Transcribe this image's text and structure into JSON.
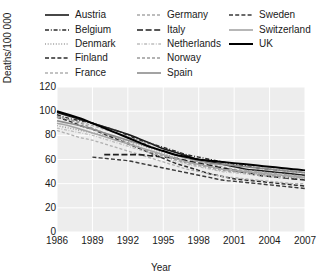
{
  "chart_data": {
    "type": "line",
    "title": "",
    "xlabel": "Year",
    "ylabel": "Deaths/100 000",
    "xlim": [
      1986,
      2007
    ],
    "ylim": [
      0,
      120
    ],
    "xticks": [
      1986,
      1989,
      1992,
      1995,
      1998,
      2001,
      2004,
      2007
    ],
    "yticks": [
      0,
      20,
      40,
      60,
      80,
      100,
      120
    ],
    "grid": true,
    "legend_position": "top",
    "x": [
      1986,
      1987,
      1988,
      1989,
      1990,
      1991,
      1992,
      1993,
      1994,
      1995,
      1996,
      1997,
      1998,
      1999,
      2000,
      2001,
      2002,
      2003,
      2004,
      2005,
      2006,
      2007
    ],
    "series": [
      {
        "name": "Austria",
        "style": "solid",
        "color": "#1a1a1a",
        "width": 1.6,
        "values": [
          99,
          96,
          93,
          90,
          87,
          84,
          81,
          77,
          73,
          69,
          66,
          63,
          60,
          58,
          56,
          54,
          52,
          51,
          50,
          49,
          48,
          47
        ]
      },
      {
        "name": "Belgium",
        "style": "dashdot",
        "color": "#2b2b2b",
        "width": 1.4,
        "values": [
          97,
          94,
          92,
          90,
          87,
          84,
          80,
          76,
          73,
          70,
          67,
          64,
          62,
          60,
          58,
          56,
          55,
          53,
          52,
          51,
          50,
          49
        ]
      },
      {
        "name": "Denmark",
        "style": "dotted",
        "color": "#9e9e9e",
        "width": 1.4,
        "values": [
          88,
          86,
          84,
          82,
          80,
          78,
          75,
          72,
          69,
          65,
          62,
          59,
          56,
          54,
          52,
          50,
          49,
          48,
          47,
          46,
          45,
          44
        ]
      },
      {
        "name": "Finland",
        "style": "dashed",
        "color": "#2b2b2b",
        "width": 1.5,
        "values": [
          95,
          92,
          88,
          85,
          81,
          77,
          73,
          69,
          65,
          61,
          57,
          54,
          51,
          48,
          46,
          44,
          43,
          42,
          41,
          40,
          39,
          38
        ]
      },
      {
        "name": "France",
        "style": "dashed-fine",
        "color": "#b0b0b0",
        "width": 1.3,
        "values": [
          84,
          81,
          78,
          76,
          73,
          70,
          67,
          64,
          61,
          58,
          55,
          52,
          50,
          48,
          46,
          45,
          44,
          43,
          42,
          41,
          40,
          40
        ]
      },
      {
        "name": "Germany",
        "style": "dashed-fine",
        "color": "#a8a8a8",
        "width": 1.3,
        "values": [
          95,
          93,
          91,
          88,
          85,
          82,
          79,
          75,
          71,
          67,
          64,
          61,
          58,
          56,
          54,
          52,
          51,
          50,
          49,
          48,
          47,
          46
        ]
      },
      {
        "name": "Italy",
        "style": "dashed-long",
        "color": "#1f1f1f",
        "width": 1.6,
        "values": [
          null,
          null,
          null,
          null,
          64,
          64,
          64,
          64,
          63,
          62,
          61,
          59,
          57,
          55,
          53,
          51,
          49,
          47,
          46,
          45,
          44,
          43
        ]
      },
      {
        "name": "Netherlands",
        "style": "dashdot-fine",
        "color": "#bdbdbd",
        "width": 1.3,
        "values": [
          86,
          84,
          82,
          80,
          77,
          74,
          71,
          68,
          65,
          62,
          59,
          56,
          54,
          52,
          50,
          49,
          48,
          47,
          46,
          45,
          45,
          44
        ]
      },
      {
        "name": "Norway",
        "style": "dashed-fine",
        "color": "#9a9a9a",
        "width": 1.3,
        "values": [
          96,
          93,
          90,
          86,
          82,
          78,
          74,
          70,
          66,
          63,
          60,
          57,
          55,
          53,
          51,
          50,
          49,
          48,
          47,
          46,
          46,
          45
        ]
      },
      {
        "name": "Spain",
        "style": "solid",
        "color": "#8c8c8c",
        "width": 1.6,
        "values": [
          92,
          90,
          88,
          85,
          82,
          79,
          76,
          73,
          70,
          67,
          64,
          61,
          59,
          57,
          56,
          55,
          54,
          53,
          52,
          51,
          50,
          49
        ]
      },
      {
        "name": "Sweden",
        "style": "dashed",
        "color": "#3a3a3a",
        "width": 1.4,
        "values": [
          null,
          null,
          null,
          62,
          61,
          60,
          59,
          57,
          55,
          53,
          51,
          49,
          47,
          45,
          43,
          42,
          41,
          40,
          39,
          38,
          37,
          36
        ]
      },
      {
        "name": "Switzerland",
        "style": "solid",
        "color": "#a5a5a5",
        "width": 1.6,
        "values": [
          90,
          88,
          85,
          82,
          79,
          76,
          73,
          70,
          67,
          64,
          61,
          58,
          56,
          54,
          52,
          51,
          50,
          49,
          48,
          47,
          46,
          45
        ]
      },
      {
        "name": "UK",
        "style": "solid",
        "color": "#000000",
        "width": 2.0,
        "values": [
          100,
          97,
          94,
          90,
          86,
          82,
          78,
          74,
          70,
          67,
          64,
          62,
          60,
          59,
          58,
          57,
          56,
          55,
          54,
          53,
          52,
          51
        ]
      }
    ]
  },
  "legend": {
    "columns": [
      [
        {
          "label": "Austria",
          "style": "solid",
          "color": "#1a1a1a",
          "width": 1.6
        },
        {
          "label": "Belgium",
          "style": "dashdot",
          "color": "#2b2b2b",
          "width": 1.4
        },
        {
          "label": "Denmark",
          "style": "dotted",
          "color": "#9e9e9e",
          "width": 1.4
        },
        {
          "label": "Finland",
          "style": "dashed",
          "color": "#2b2b2b",
          "width": 1.5
        },
        {
          "label": "France",
          "style": "dashed-fine",
          "color": "#b0b0b0",
          "width": 1.3
        }
      ],
      [
        {
          "label": "Germany",
          "style": "dashed-fine",
          "color": "#a8a8a8",
          "width": 1.3
        },
        {
          "label": "Italy",
          "style": "dashed-long",
          "color": "#1f1f1f",
          "width": 1.6
        },
        {
          "label": "Netherlands",
          "style": "dashdot-fine",
          "color": "#bdbdbd",
          "width": 1.3
        },
        {
          "label": "Norway",
          "style": "dashed-fine",
          "color": "#9a9a9a",
          "width": 1.3
        },
        {
          "label": "Spain",
          "style": "solid",
          "color": "#8c8c8c",
          "width": 1.6
        }
      ],
      [
        {
          "label": "Sweden",
          "style": "dashed",
          "color": "#3a3a3a",
          "width": 1.4
        },
        {
          "label": "Switzerland",
          "style": "solid",
          "color": "#a5a5a5",
          "width": 1.6
        },
        {
          "label": "UK",
          "style": "solid",
          "color": "#000000",
          "width": 2.0
        }
      ]
    ]
  },
  "style": {
    "plot_bg": "#ededed",
    "grid_color": "#ffffff",
    "text_color": "#1a1a1a",
    "page_bg": "#ffffff"
  }
}
